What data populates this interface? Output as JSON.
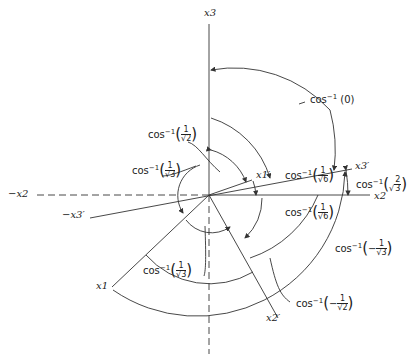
{
  "diagram": {
    "axes": {
      "x3": "x3",
      "x2": "x2",
      "neg_x2": "−x2",
      "x1": "x1",
      "x1_prime": "x1′",
      "x2_prime": "x2′",
      "x3_prime": "x3′",
      "neg_x3_prime": "−x3′"
    },
    "angle_labels": [
      {
        "id": "cos0",
        "func": "cos",
        "exp": "−1",
        "arg": "(0)"
      },
      {
        "id": "cos_sqrt2_3",
        "func": "cos",
        "exp": "−1",
        "sign": "",
        "num": "2",
        "den": "3"
      },
      {
        "id": "cos_1_sqrt6_upper",
        "func": "cos",
        "exp": "−1",
        "sign": "",
        "num": "1",
        "den": "6"
      },
      {
        "id": "cos_1_sqrt6_lower",
        "func": "cos",
        "exp": "−1",
        "sign": "",
        "num": "1",
        "den": "6"
      },
      {
        "id": "cos_neg_1_sqrt3",
        "func": "cos",
        "exp": "−1",
        "sign": "−",
        "num": "1",
        "den": "3"
      },
      {
        "id": "cos_neg_1_sqrt2",
        "func": "cos",
        "exp": "−1",
        "sign": "−",
        "num": "1",
        "den": "2"
      },
      {
        "id": "cos_1_sqrt2",
        "func": "cos",
        "exp": "−1",
        "sign": "",
        "num": "1",
        "den": "2"
      },
      {
        "id": "cos_1_sqrt3_upper",
        "func": "cos",
        "exp": "−1",
        "sign": "",
        "num": "1",
        "den": "3"
      },
      {
        "id": "cos_1_sqrt3_lower",
        "func": "cos",
        "exp": "−1",
        "sign": "",
        "num": "1",
        "den": "3"
      }
    ],
    "colors": {
      "line": "#333333",
      "background": "#ffffff"
    }
  }
}
